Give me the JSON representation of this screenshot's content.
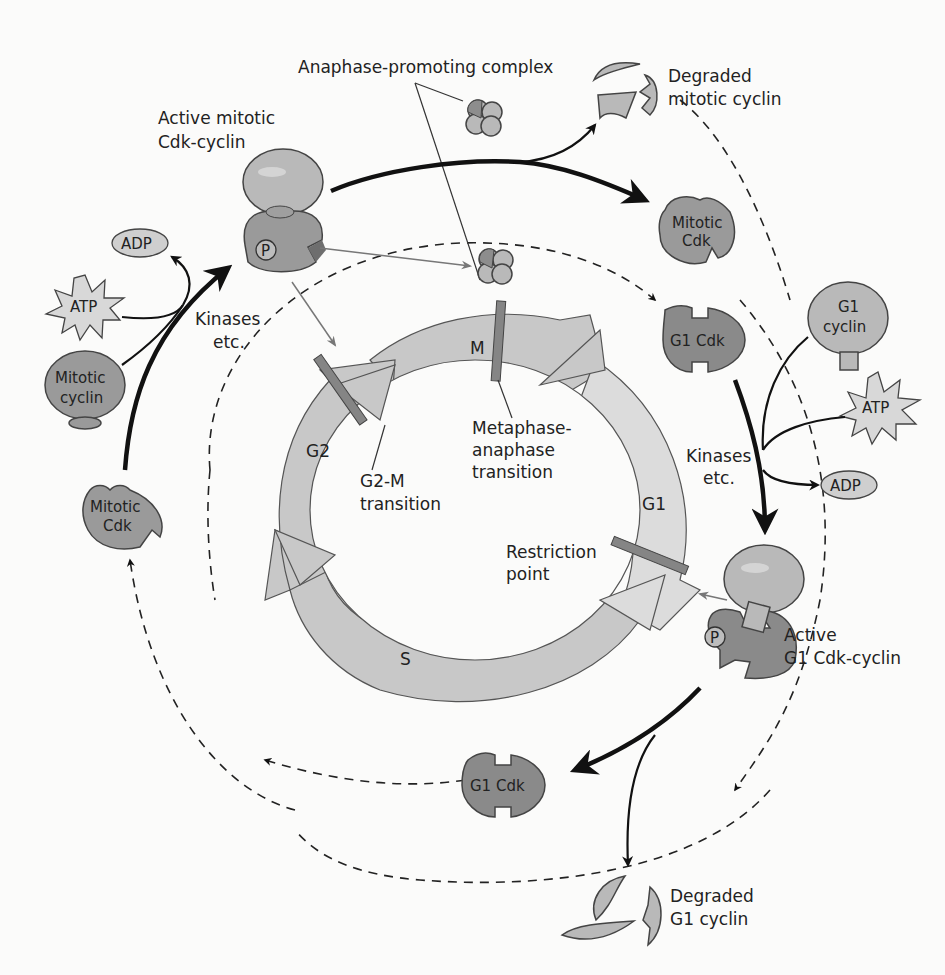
{
  "diagram": {
    "phases": [
      {
        "id": "M",
        "label": "M"
      },
      {
        "id": "G1",
        "label": "G1"
      },
      {
        "id": "S",
        "label": "S"
      },
      {
        "id": "G2",
        "label": "G2"
      }
    ],
    "checkpoints": {
      "g2m": {
        "line1": "G2-M",
        "line2": "transition"
      },
      "metaphase": {
        "line1": "Metaphase-",
        "line2": "anaphase",
        "line3": "transition"
      },
      "restriction": {
        "line1": "Restriction",
        "line2": "point"
      }
    },
    "labels": {
      "apc": "Anaphase-promoting complex",
      "degraded_mitotic": {
        "line1": "Degraded",
        "line2": "mitotic cyclin"
      },
      "active_mitotic": {
        "line1": "Active mitotic",
        "line2": "Cdk-cyclin"
      },
      "active_g1": {
        "line1": "Active",
        "line2": "G1 Cdk-cyclin"
      },
      "degraded_g1": {
        "line1": "Degraded",
        "line2": "G1 cyclin"
      },
      "kinases_left": {
        "line1": "Kinases",
        "line2": "etc."
      },
      "kinases_right": {
        "line1": "Kinases",
        "line2": "etc."
      }
    },
    "molecules": {
      "adp_left": "ADP",
      "atp_left": "ATP",
      "mitotic_cyclin": {
        "line1": "Mitotic",
        "line2": "cyclin"
      },
      "mitotic_cdk_left": {
        "line1": "Mitotic",
        "line2": "Cdk"
      },
      "mitotic_cdk_right": {
        "line1": "Mitotic",
        "line2": "Cdk"
      },
      "g1_cdk_top": "G1 Cdk",
      "g1_cyclin": {
        "line1": "G1",
        "line2": "cyclin"
      },
      "atp_right": "ATP",
      "adp_right": "ADP",
      "g1_cdk_bottom": "G1 Cdk",
      "phospho": "P"
    }
  }
}
